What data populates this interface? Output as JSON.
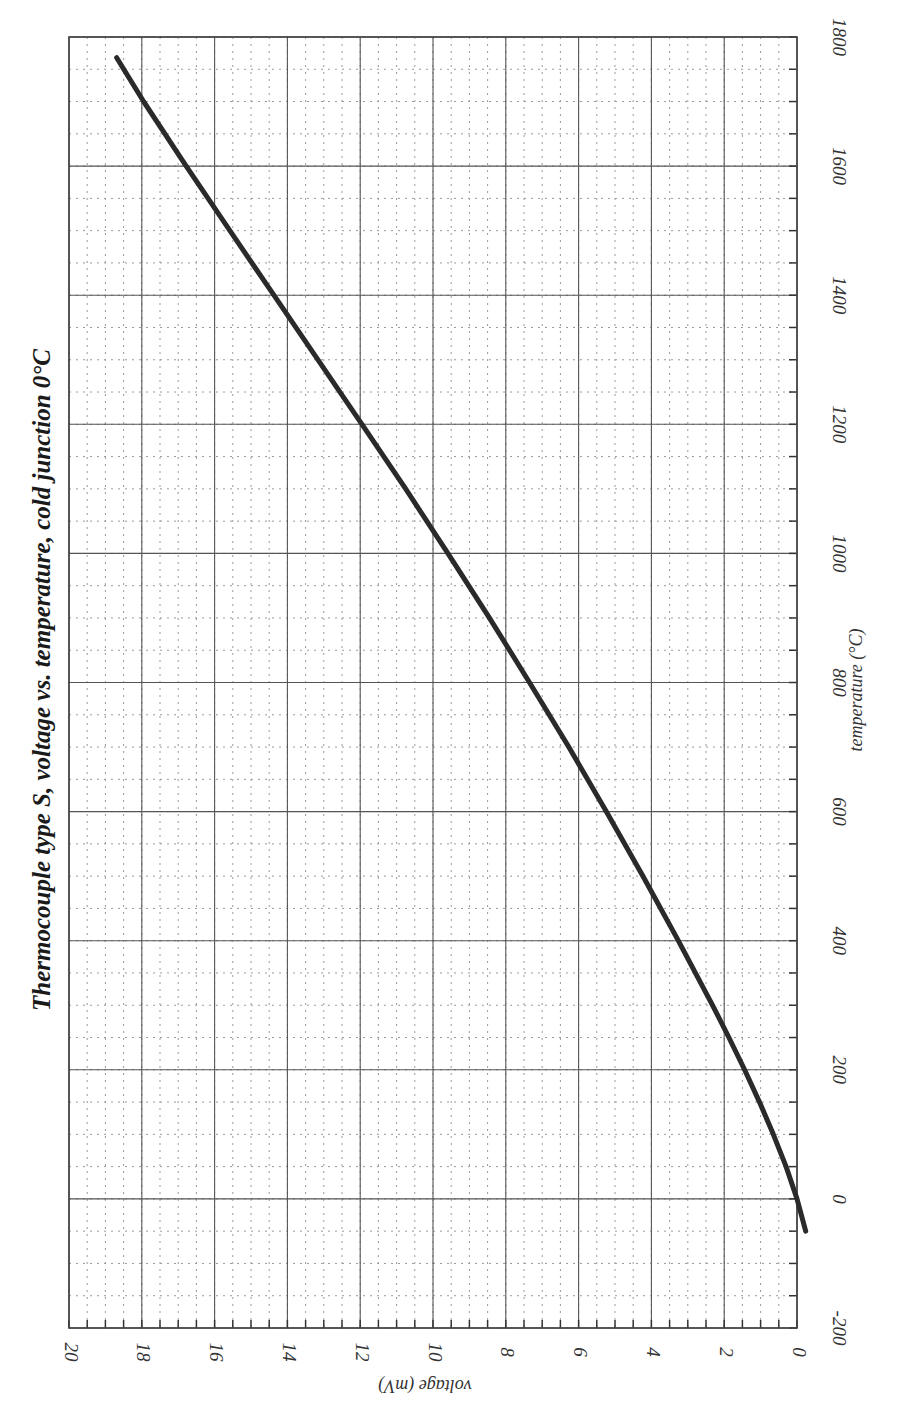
{
  "chart_data": {
    "type": "line",
    "orientation": "rotated 90° counter-clockwise (temperature axis runs vertically, voltage axis runs horizontally right-to-left)",
    "title": "Thermocouple type S, voltage vs. temperature, cold junction 0°C",
    "xlabel": "temperature (°C)",
    "ylabel": "voltage (mV)",
    "xlim": [
      -200,
      1800
    ],
    "ylim": [
      0,
      20
    ],
    "x_ticks": [
      -200,
      0,
      200,
      400,
      600,
      800,
      1000,
      1200,
      1400,
      1600,
      1800
    ],
    "y_ticks": [
      0,
      2,
      4,
      6,
      8,
      10,
      12,
      14,
      16,
      18,
      20
    ],
    "x_minor_step": 50,
    "y_minor_step": 0.5,
    "grid": true,
    "grid_major_style": "solid",
    "grid_minor_style": "dotted",
    "legend": null,
    "series": [
      {
        "name": "Type S thermocouple EMF",
        "color": "#2a2a2a",
        "x": [
          -50,
          0,
          50,
          100,
          150,
          200,
          250,
          300,
          400,
          500,
          600,
          700,
          800,
          900,
          1000,
          1100,
          1200,
          1300,
          1400,
          1500,
          1600,
          1700,
          1768
        ],
        "y": [
          -0.24,
          0.0,
          0.3,
          0.65,
          1.03,
          1.44,
          1.87,
          2.32,
          3.26,
          4.23,
          5.24,
          6.27,
          7.35,
          8.45,
          9.59,
          10.75,
          11.95,
          13.16,
          14.37,
          15.58,
          16.78,
          17.95,
          18.69
        ]
      }
    ]
  },
  "labels": {
    "title": "Thermocouple type S, voltage vs. temperature, cold junction 0°C",
    "x_axis": "temperature (°C)",
    "y_axis": "voltage (mV)"
  }
}
